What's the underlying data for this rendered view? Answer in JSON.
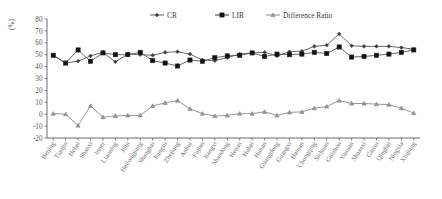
{
  "chart_data": {
    "type": "line",
    "title": "",
    "xlabel": "",
    "ylabel": "(%)",
    "ylim": [
      -20,
      80
    ],
    "ytick_step": 10,
    "yticks": [
      80,
      70,
      60,
      50,
      40,
      30,
      20,
      10,
      0,
      -10,
      -20
    ],
    "grid": false,
    "legend_position": "top-center",
    "categories": [
      "Beijing",
      "Tianjin",
      "Hebei",
      "Shanxi",
      "Inner",
      "Liaoning",
      "Jilin",
      "Heilongjiang",
      "Shanghai",
      "Jiangsu",
      "Zhejiang",
      "Anhui",
      "Fujian",
      "Jiangxi",
      "Shandong",
      "Henan",
      "Hubei",
      "Hunan",
      "Guangdong",
      "Guangxi",
      "Hainan",
      "Chongqing",
      "Sichuan",
      "Guizhou",
      "Yunnan",
      "Shaanxi",
      "Gansu",
      "Qinghai",
      "Ningxia",
      "Xinjiang"
    ],
    "series": [
      {
        "name": "CR",
        "marker": "diamond",
        "values": [
          49.5,
          43.0,
          44.5,
          49.0,
          52.0,
          44.0,
          50.5,
          50.0,
          49.5,
          52.0,
          52.5,
          50.5,
          45.5,
          45.0,
          47.5,
          50.5,
          51.5,
          52.0,
          49.0,
          52.5,
          53.0,
          57.0,
          58.0,
          67.5,
          57.5,
          57.0,
          57.0,
          57.0,
          56.0,
          54.5
        ]
      },
      {
        "name": "LIR",
        "marker": "square",
        "values": [
          49.5,
          43.0,
          54.0,
          44.5,
          51.5,
          50.0,
          50.0,
          52.0,
          45.0,
          43.0,
          40.5,
          45.5,
          44.5,
          47.5,
          49.0,
          49.5,
          51.5,
          48.5,
          50.5,
          50.0,
          50.5,
          52.0,
          51.0,
          56.5,
          48.0,
          48.5,
          49.5,
          50.5,
          52.0,
          54.0
        ]
      },
      {
        "name": "Difference Ratio",
        "marker": "triangle",
        "values": [
          0.5,
          0.0,
          -9.5,
          7.0,
          -2.5,
          -1.5,
          -1.0,
          -1.0,
          7.0,
          9.5,
          11.5,
          4.5,
          0.5,
          -1.5,
          -1.0,
          0.5,
          0.5,
          2.0,
          -1.0,
          1.5,
          2.0,
          5.0,
          6.5,
          11.5,
          9.0,
          9.0,
          8.5,
          8.0,
          5.0,
          1.0
        ]
      }
    ]
  },
  "legend": {
    "items": [
      {
        "label": "CR"
      },
      {
        "label": "LIR"
      },
      {
        "label": "Difference Ratio"
      }
    ]
  },
  "colors": {
    "cr": "#4d4d4d",
    "lir": "#1f1f1f",
    "diff": "#7d7d7d",
    "axis": "#4a4a4a",
    "text": "#5a5a5a"
  }
}
